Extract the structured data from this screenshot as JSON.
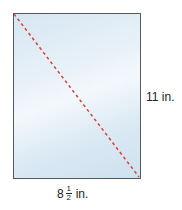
{
  "figure": {
    "shape": "rectangle",
    "diagonal": {
      "style": "dashed",
      "color": "#d9413a"
    },
    "height_label": "11 in.",
    "width_label": {
      "whole": "8",
      "numerator": "1",
      "denominator": "2",
      "unit": "in."
    },
    "fill_color": "#e3eef7",
    "border_color": "#555a5e"
  }
}
